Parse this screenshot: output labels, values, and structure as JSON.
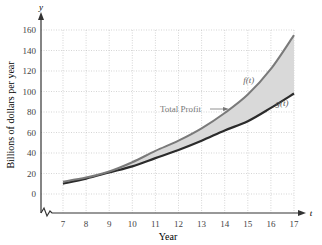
{
  "chart_data": {
    "type": "line",
    "title": "",
    "xlabel": "Year",
    "ylabel": "Billions of dollars per year",
    "x_axis_symbol": "t",
    "y_axis_symbol": "y",
    "x": [
      7,
      8,
      9,
      10,
      11,
      12,
      13,
      14,
      15,
      16,
      17
    ],
    "xlim": [
      7,
      17
    ],
    "ylim": [
      0,
      160
    ],
    "x_ticks": [
      7,
      8,
      9,
      10,
      11,
      12,
      13,
      14,
      15,
      16,
      17
    ],
    "y_ticks": [
      0,
      20,
      40,
      60,
      80,
      100,
      120,
      140,
      160
    ],
    "grid": true,
    "axis_break": true,
    "series": [
      {
        "name": "f(t)",
        "values": [
          12,
          16,
          22,
          31,
          42,
          52,
          64,
          79,
          97,
          122,
          155
        ],
        "color": "#7a7a7a"
      },
      {
        "name": "g(t)",
        "values": [
          10,
          15,
          21,
          27,
          35,
          43,
          52,
          62,
          71,
          84,
          98
        ],
        "color": "#2b2b2b"
      }
    ],
    "shaded_region": {
      "between": [
        "f(t)",
        "g(t)"
      ],
      "label": "Total Profit",
      "color": "#d9d9d9"
    },
    "annotations": [
      {
        "text": "f(t)",
        "x": 14.8,
        "y": 108
      },
      {
        "text": "g(t)",
        "x": 16.2,
        "y": 86
      },
      {
        "text": "Total Profit",
        "x": 12.5,
        "y": 82,
        "arrow": true
      }
    ]
  }
}
